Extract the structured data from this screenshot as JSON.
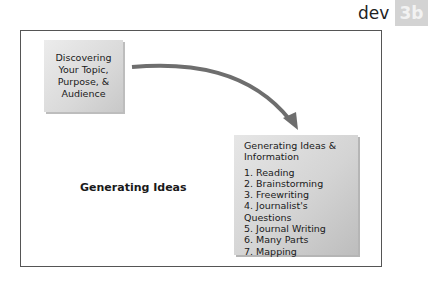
{
  "header": {
    "section_word": "dev",
    "section_tab": "3b"
  },
  "diagram": {
    "start_box": {
      "lines": [
        "Discovering",
        "Your Topic,",
        "Purpose, &",
        "Audience"
      ]
    },
    "center_label": "Generating Ideas",
    "end_box": {
      "title_lines": [
        "Generating Ideas &",
        "Information"
      ],
      "items": [
        "1. Reading",
        "2. Brainstorming",
        "3. Freewriting",
        "4. Journalist's Questions",
        "5. Journal Writing",
        "6. Many Parts",
        "7. Mapping"
      ]
    },
    "arrow": {
      "from": "start_box",
      "to": "end_box",
      "color": "#6e6e6e"
    }
  },
  "colors": {
    "tab_bg": "#d3d3d3",
    "box_bg": "#d9d9d9",
    "frame": "#555555"
  }
}
